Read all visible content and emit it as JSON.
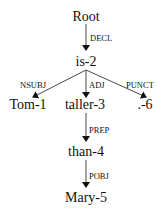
{
  "diagram": {
    "type": "dependency-tree",
    "nodes": {
      "root": "Root",
      "is": "is-2",
      "tom": "Tom-1",
      "taller": "taller-3",
      "punct": ".-6",
      "than": "than-4",
      "mary": "Mary-5"
    },
    "edges": {
      "decl": "DECL",
      "nsubj": "NSUBJ",
      "adj": "ADJ",
      "punct": "PUNCT",
      "prep": "PREP",
      "pobj": "POBJ"
    },
    "edge_list": [
      {
        "from": "Root",
        "to": "is-2",
        "label": "DECL"
      },
      {
        "from": "is-2",
        "to": "Tom-1",
        "label": "NSUBJ"
      },
      {
        "from": "is-2",
        "to": "taller-3",
        "label": "ADJ"
      },
      {
        "from": "is-2",
        "to": ".-6",
        "label": "PUNCT"
      },
      {
        "from": "taller-3",
        "to": "than-4",
        "label": "PREP"
      },
      {
        "from": "than-4",
        "to": "Mary-5",
        "label": "POBJ"
      }
    ]
  }
}
